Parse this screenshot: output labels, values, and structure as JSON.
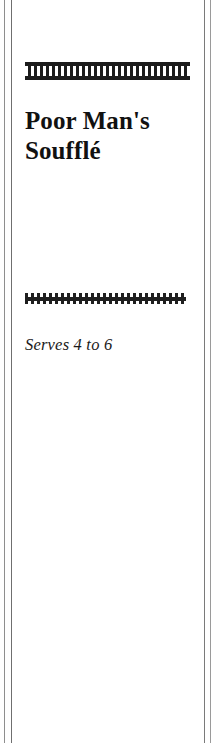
{
  "page": {
    "background_color": "#ffffff",
    "width": 222,
    "height": 743
  },
  "column_rules": {
    "ink_color": "#7a7a7a",
    "left_outer_label": "left-outer-column-rule",
    "left_inner_label": "left-inner-column-rule",
    "right_inner_label": "right-inner-column-rule",
    "right_outer_label": "right-outer-column-rule"
  },
  "ornaments": {
    "top": {
      "name": "castellated-bar-ornament",
      "ink_color": "#1c1c1c"
    },
    "middle": {
      "name": "square-wave-ornament",
      "ink_color": "#1f1f1f"
    }
  },
  "recipe": {
    "title_line_1": "Poor Man's",
    "title_line_2": "Soufflé",
    "title_full": "Poor Man's Soufflé",
    "yield": "Serves 4 to 6"
  }
}
